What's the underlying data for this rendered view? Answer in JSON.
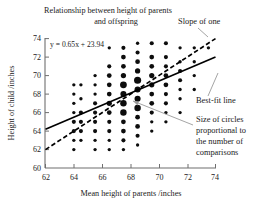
{
  "chart_data": {
    "type": "scatter",
    "title": "Relationship between height of parents and offspring",
    "title_line1": "Relationship between height of parents",
    "title_line2": "and offspring",
    "xlabel": "Mean height of parents /inches",
    "ylabel": "Height of child /inches",
    "xlim": [
      62,
      74
    ],
    "ylim": [
      60,
      74
    ],
    "xticks": [
      62,
      64,
      66,
      68,
      70,
      72,
      74
    ],
    "yticks": [
      60,
      62,
      64,
      66,
      68,
      70,
      72,
      74
    ],
    "grid": false,
    "legend_position": "none",
    "equation": "y = 0.65x + 23.94",
    "series": [
      {
        "name": "Galton parent-child heights",
        "marker": "circle",
        "size_meaning": "circle area proportional to number of comparisons",
        "points": [
          {
            "x": 64.0,
            "y": 69.0,
            "n": 1
          },
          {
            "x": 64.0,
            "y": 68.0,
            "n": 1
          },
          {
            "x": 64.0,
            "y": 67.0,
            "n": 1
          },
          {
            "x": 64.0,
            "y": 66.0,
            "n": 1
          },
          {
            "x": 64.0,
            "y": 65.0,
            "n": 2
          },
          {
            "x": 64.0,
            "y": 64.0,
            "n": 2
          },
          {
            "x": 64.0,
            "y": 63.0,
            "n": 1
          },
          {
            "x": 64.0,
            "y": 62.0,
            "n": 1
          },
          {
            "x": 64.5,
            "y": 69.0,
            "n": 1
          },
          {
            "x": 64.5,
            "y": 67.5,
            "n": 1
          },
          {
            "x": 64.5,
            "y": 66.0,
            "n": 2
          },
          {
            "x": 64.5,
            "y": 65.0,
            "n": 2
          },
          {
            "x": 64.5,
            "y": 64.0,
            "n": 2
          },
          {
            "x": 64.5,
            "y": 63.0,
            "n": 1
          },
          {
            "x": 65.5,
            "y": 70.0,
            "n": 1
          },
          {
            "x": 65.5,
            "y": 69.0,
            "n": 1
          },
          {
            "x": 65.5,
            "y": 68.0,
            "n": 1
          },
          {
            "x": 65.5,
            "y": 67.0,
            "n": 2
          },
          {
            "x": 65.5,
            "y": 66.0,
            "n": 2
          },
          {
            "x": 65.5,
            "y": 65.0,
            "n": 2
          },
          {
            "x": 65.5,
            "y": 64.0,
            "n": 2
          },
          {
            "x": 65.5,
            "y": 63.0,
            "n": 1
          },
          {
            "x": 65.5,
            "y": 62.0,
            "n": 1
          },
          {
            "x": 66.5,
            "y": 73.0,
            "n": 1
          },
          {
            "x": 66.5,
            "y": 71.0,
            "n": 2
          },
          {
            "x": 66.5,
            "y": 70.0,
            "n": 3
          },
          {
            "x": 66.5,
            "y": 69.0,
            "n": 3
          },
          {
            "x": 66.5,
            "y": 68.0,
            "n": 3
          },
          {
            "x": 66.5,
            "y": 67.0,
            "n": 4
          },
          {
            "x": 66.5,
            "y": 66.0,
            "n": 3
          },
          {
            "x": 66.5,
            "y": 65.0,
            "n": 2
          },
          {
            "x": 66.5,
            "y": 64.0,
            "n": 2
          },
          {
            "x": 66.5,
            "y": 63.0,
            "n": 1
          },
          {
            "x": 66.5,
            "y": 62.0,
            "n": 1
          },
          {
            "x": 67.5,
            "y": 73.0,
            "n": 2
          },
          {
            "x": 67.5,
            "y": 72.0,
            "n": 3
          },
          {
            "x": 67.5,
            "y": 71.0,
            "n": 3
          },
          {
            "x": 67.5,
            "y": 70.0,
            "n": 4
          },
          {
            "x": 67.5,
            "y": 69.0,
            "n": 8
          },
          {
            "x": 67.5,
            "y": 68.0,
            "n": 6
          },
          {
            "x": 67.5,
            "y": 67.0,
            "n": 7
          },
          {
            "x": 67.5,
            "y": 66.0,
            "n": 7
          },
          {
            "x": 67.5,
            "y": 65.0,
            "n": 3
          },
          {
            "x": 67.5,
            "y": 64.0,
            "n": 3
          },
          {
            "x": 67.5,
            "y": 63.0,
            "n": 2
          },
          {
            "x": 67.5,
            "y": 62.0,
            "n": 1
          },
          {
            "x": 68.5,
            "y": 73.5,
            "n": 1
          },
          {
            "x": 68.5,
            "y": 72.5,
            "n": 2
          },
          {
            "x": 68.5,
            "y": 71.5,
            "n": 3
          },
          {
            "x": 68.5,
            "y": 70.5,
            "n": 4
          },
          {
            "x": 68.5,
            "y": 69.5,
            "n": 9
          },
          {
            "x": 68.5,
            "y": 68.5,
            "n": 6
          },
          {
            "x": 68.5,
            "y": 67.5,
            "n": 6
          },
          {
            "x": 68.5,
            "y": 66.5,
            "n": 7
          },
          {
            "x": 68.5,
            "y": 65.5,
            "n": 3
          },
          {
            "x": 68.5,
            "y": 64.5,
            "n": 3
          },
          {
            "x": 68.5,
            "y": 63.5,
            "n": 2
          },
          {
            "x": 68.5,
            "y": 62.5,
            "n": 1
          },
          {
            "x": 69.5,
            "y": 73.5,
            "n": 2
          },
          {
            "x": 69.5,
            "y": 72.0,
            "n": 3
          },
          {
            "x": 69.5,
            "y": 71.0,
            "n": 3
          },
          {
            "x": 69.5,
            "y": 70.0,
            "n": 4
          },
          {
            "x": 69.5,
            "y": 69.0,
            "n": 4
          },
          {
            "x": 69.5,
            "y": 68.0,
            "n": 3
          },
          {
            "x": 69.5,
            "y": 67.0,
            "n": 3
          },
          {
            "x": 69.5,
            "y": 66.0,
            "n": 2
          },
          {
            "x": 69.5,
            "y": 65.0,
            "n": 1
          },
          {
            "x": 69.5,
            "y": 64.0,
            "n": 1
          },
          {
            "x": 70.5,
            "y": 73.5,
            "n": 2
          },
          {
            "x": 70.5,
            "y": 72.0,
            "n": 2
          },
          {
            "x": 70.5,
            "y": 71.0,
            "n": 2
          },
          {
            "x": 70.5,
            "y": 70.0,
            "n": 3
          },
          {
            "x": 70.5,
            "y": 69.0,
            "n": 3
          },
          {
            "x": 70.5,
            "y": 68.0,
            "n": 2
          },
          {
            "x": 70.5,
            "y": 67.0,
            "n": 2
          },
          {
            "x": 70.5,
            "y": 66.0,
            "n": 1
          },
          {
            "x": 70.5,
            "y": 65.0,
            "n": 1
          },
          {
            "x": 71.5,
            "y": 73.0,
            "n": 1
          },
          {
            "x": 71.5,
            "y": 71.5,
            "n": 1
          },
          {
            "x": 71.5,
            "y": 70.5,
            "n": 2
          },
          {
            "x": 71.5,
            "y": 69.5,
            "n": 2
          },
          {
            "x": 71.5,
            "y": 68.5,
            "n": 1
          },
          {
            "x": 71.5,
            "y": 67.5,
            "n": 1
          },
          {
            "x": 71.5,
            "y": 66.0,
            "n": 1
          },
          {
            "x": 72.5,
            "y": 73.0,
            "n": 1
          },
          {
            "x": 72.5,
            "y": 71.5,
            "n": 1
          },
          {
            "x": 72.5,
            "y": 70.0,
            "n": 1
          },
          {
            "x": 72.5,
            "y": 68.5,
            "n": 1
          },
          {
            "x": 73.5,
            "y": 73.0,
            "n": 1
          }
        ]
      }
    ],
    "lines": [
      {
        "name": "best-fit line",
        "style": "solid",
        "slope": 0.65,
        "intercept": 23.94,
        "x_from": 62,
        "x_to": 74,
        "y_from": 64.2,
        "y_to": 72.0
      },
      {
        "name": "slope of one",
        "style": "dashed",
        "slope": 1.0,
        "x_from": 62,
        "x_to": 74,
        "y_from": 62.0,
        "y_to": 74.0
      }
    ],
    "annotations": [
      {
        "id": "slope-of-one",
        "text": "Slope of one"
      },
      {
        "id": "best-fit-line",
        "text": "Best-fit line"
      },
      {
        "id": "circle-size",
        "text": "Size of circles proportional to the number of comparisons",
        "lines": [
          "Size of circles",
          "proportional to",
          "the number of",
          "comparisons"
        ]
      }
    ]
  }
}
